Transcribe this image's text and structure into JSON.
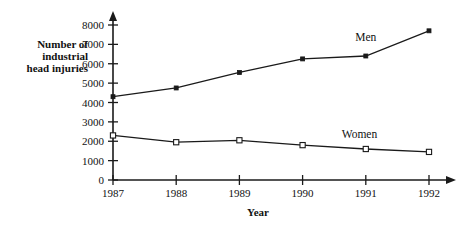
{
  "chart_data": {
    "type": "line",
    "title": "",
    "xlabel": "Year",
    "ylabel": "Number of industrial head injuries",
    "categories": [
      "1987",
      "1988",
      "1989",
      "1990",
      "1991",
      "1992"
    ],
    "x": [
      1987,
      1988,
      1989,
      1990,
      1991,
      1992
    ],
    "series": [
      {
        "name": "Men",
        "values": [
          4300,
          4750,
          5550,
          6250,
          6400,
          7700
        ],
        "marker": "filled-square",
        "label_x": 1991.0,
        "label_y": 7400
      },
      {
        "name": "Women",
        "values": [
          2300,
          1950,
          2050,
          1800,
          1600,
          1450
        ],
        "marker": "open-square",
        "label_x": 1990.9,
        "label_y": 2400
      }
    ],
    "ylim": [
      0,
      8000
    ],
    "xlim": [
      1986.6,
      1992.55
    ],
    "yticks": [
      0,
      1000,
      2000,
      3000,
      4000,
      5000,
      6000,
      7000,
      8000
    ],
    "ytick_labels": [
      "0",
      "1000",
      "2000",
      "3000",
      "4000",
      "5000",
      "6000",
      "7000",
      "8000"
    ],
    "grid": false,
    "legend": "inline-series-labels"
  },
  "axes": {
    "y_axis_title_lines": [
      "Number of",
      "industrial",
      "head injuries"
    ],
    "x_axis_title": "Year"
  },
  "colors": {
    "ink": "#1a1a1a",
    "background": "#ffffff"
  }
}
